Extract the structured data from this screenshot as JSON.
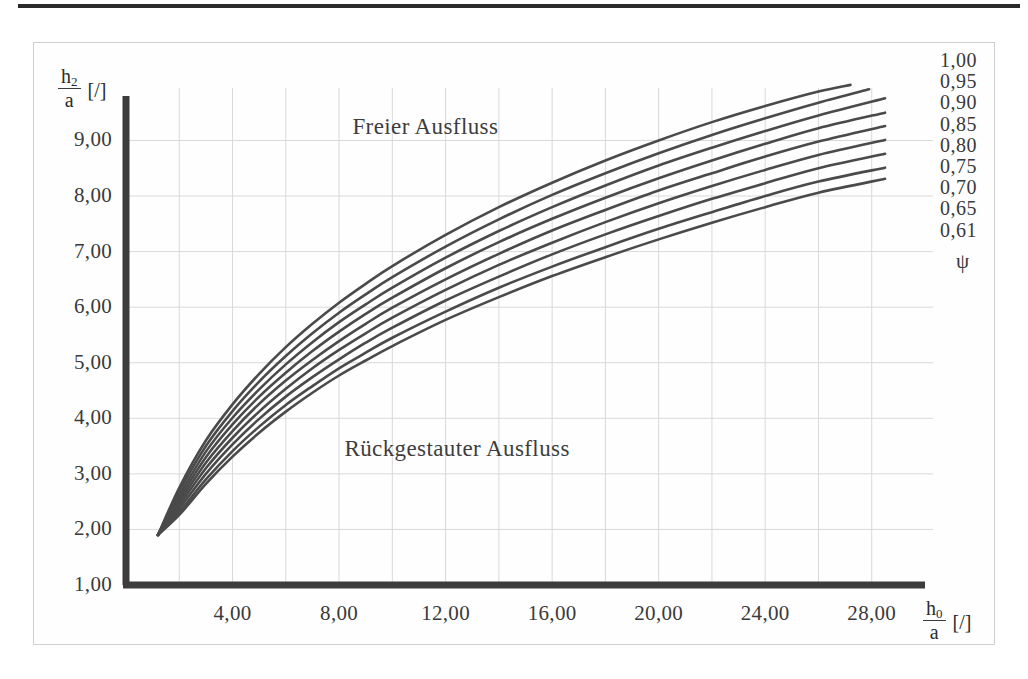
{
  "figure": {
    "name": "ausfluss-diagram",
    "top_rule": true
  },
  "chart_data": {
    "type": "line",
    "title": "",
    "xlabel": "h0/a [/]",
    "ylabel": "h2/a [/]",
    "xlabel_numerator": "h",
    "xlabel_numerator_sub": "0",
    "xlabel_denominator": "a",
    "xlabel_unit": "[/]",
    "ylabel_numerator": "h",
    "ylabel_numerator_sub": "2",
    "ylabel_denominator": "a",
    "ylabel_unit": "[/]",
    "xlim": [
      0,
      30
    ],
    "ylim": [
      1,
      9.8
    ],
    "xticks": [
      4,
      8,
      12,
      16,
      20,
      24,
      28
    ],
    "xtick_labels": [
      "4,00",
      "8,00",
      "12,00",
      "16,00",
      "20,00",
      "24,00",
      "28,00"
    ],
    "yticks": [
      1,
      2,
      3,
      4,
      5,
      6,
      7,
      8,
      9
    ],
    "ytick_labels": [
      "1,00",
      "2,00",
      "3,00",
      "4,00",
      "5,00",
      "6,00",
      "7,00",
      "8,00",
      "9,00"
    ],
    "grid": true,
    "grid_minor_x_step": 2,
    "grid_minor_y_step": 1,
    "grid_color": "#d9d9d9",
    "axis_color": "#3c3c3c",
    "curve_color": "#4a4a4a",
    "legend_position": "right",
    "legend_title": "ψ",
    "annotations": [
      {
        "text": "Freier Ausfluss",
        "x": 8.5,
        "y": 9.25
      },
      {
        "text": "Rückgestauter Ausfluss",
        "x": 8.2,
        "y": 3.45
      }
    ],
    "series": [
      {
        "name": "1,00",
        "legend_label": "1,00",
        "points": [
          [
            1.2,
            1.9
          ],
          [
            2,
            2.75
          ],
          [
            3,
            3.6
          ],
          [
            4,
            4.25
          ],
          [
            5,
            4.8
          ],
          [
            6,
            5.28
          ],
          [
            7,
            5.7
          ],
          [
            8,
            6.08
          ],
          [
            9,
            6.42
          ],
          [
            10,
            6.74
          ],
          [
            12,
            7.3
          ],
          [
            14,
            7.8
          ],
          [
            16,
            8.24
          ],
          [
            18,
            8.64
          ],
          [
            20,
            9.0
          ],
          [
            22,
            9.33
          ],
          [
            24,
            9.62
          ],
          [
            26,
            9.88
          ],
          [
            27.2,
            10.0
          ]
        ]
      },
      {
        "name": "0,95",
        "legend_label": "0,95",
        "points": [
          [
            1.2,
            1.9
          ],
          [
            2,
            2.68
          ],
          [
            3,
            3.5
          ],
          [
            4,
            4.13
          ],
          [
            5,
            4.66
          ],
          [
            6,
            5.12
          ],
          [
            7,
            5.53
          ],
          [
            8,
            5.9
          ],
          [
            9,
            6.23
          ],
          [
            10,
            6.54
          ],
          [
            12,
            7.09
          ],
          [
            14,
            7.58
          ],
          [
            16,
            8.02
          ],
          [
            18,
            8.41
          ],
          [
            20,
            8.77
          ],
          [
            22,
            9.1
          ],
          [
            24,
            9.4
          ],
          [
            26,
            9.68
          ],
          [
            27.9,
            9.92
          ]
        ]
      },
      {
        "name": "0,90",
        "legend_label": "0,90",
        "points": [
          [
            1.2,
            1.9
          ],
          [
            2,
            2.61
          ],
          [
            3,
            3.4
          ],
          [
            4,
            4.01
          ],
          [
            5,
            4.52
          ],
          [
            6,
            4.97
          ],
          [
            7,
            5.37
          ],
          [
            8,
            5.73
          ],
          [
            9,
            6.05
          ],
          [
            10,
            6.35
          ],
          [
            12,
            6.89
          ],
          [
            14,
            7.37
          ],
          [
            16,
            7.8
          ],
          [
            18,
            8.19
          ],
          [
            20,
            8.55
          ],
          [
            22,
            8.87
          ],
          [
            24,
            9.17
          ],
          [
            26,
            9.45
          ],
          [
            28.5,
            9.76
          ]
        ]
      },
      {
        "name": "0,85",
        "legend_label": "0,85",
        "points": [
          [
            1.2,
            1.9
          ],
          [
            2,
            2.55
          ],
          [
            3,
            3.3
          ],
          [
            4,
            3.89
          ],
          [
            5,
            4.39
          ],
          [
            6,
            4.82
          ],
          [
            7,
            5.21
          ],
          [
            8,
            5.56
          ],
          [
            9,
            5.88
          ],
          [
            10,
            6.17
          ],
          [
            12,
            6.7
          ],
          [
            14,
            7.17
          ],
          [
            16,
            7.59
          ],
          [
            18,
            7.97
          ],
          [
            20,
            8.32
          ],
          [
            22,
            8.64
          ],
          [
            24,
            8.94
          ],
          [
            26,
            9.22
          ],
          [
            28.5,
            9.5
          ]
        ]
      },
      {
        "name": "0,80",
        "legend_label": "0,80",
        "points": [
          [
            1.2,
            1.9
          ],
          [
            2,
            2.49
          ],
          [
            3,
            3.2
          ],
          [
            4,
            3.77
          ],
          [
            5,
            4.26
          ],
          [
            6,
            4.68
          ],
          [
            7,
            5.05
          ],
          [
            8,
            5.39
          ],
          [
            9,
            5.7
          ],
          [
            10,
            5.99
          ],
          [
            12,
            6.5
          ],
          [
            14,
            6.96
          ],
          [
            16,
            7.38
          ],
          [
            18,
            7.75
          ],
          [
            20,
            8.1
          ],
          [
            22,
            8.41
          ],
          [
            24,
            8.71
          ],
          [
            26,
            8.98
          ],
          [
            28.5,
            9.26
          ]
        ]
      },
      {
        "name": "0,75",
        "legend_label": "0,75",
        "points": [
          [
            1.2,
            1.9
          ],
          [
            2,
            2.43
          ],
          [
            3,
            3.1
          ],
          [
            4,
            3.65
          ],
          [
            5,
            4.12
          ],
          [
            6,
            4.53
          ],
          [
            7,
            4.9
          ],
          [
            8,
            5.23
          ],
          [
            9,
            5.53
          ],
          [
            10,
            5.81
          ],
          [
            12,
            6.31
          ],
          [
            14,
            6.76
          ],
          [
            16,
            7.16
          ],
          [
            18,
            7.53
          ],
          [
            20,
            7.87
          ],
          [
            22,
            8.18
          ],
          [
            24,
            8.47
          ],
          [
            26,
            8.74
          ],
          [
            28.5,
            9.01
          ]
        ]
      },
      {
        "name": "0,70",
        "legend_label": "0,70",
        "points": [
          [
            1.2,
            1.9
          ],
          [
            2,
            2.37
          ],
          [
            3,
            3.0
          ],
          [
            4,
            3.53
          ],
          [
            5,
            3.99
          ],
          [
            6,
            4.39
          ],
          [
            7,
            4.74
          ],
          [
            8,
            5.06
          ],
          [
            9,
            5.36
          ],
          [
            10,
            5.63
          ],
          [
            12,
            6.12
          ],
          [
            14,
            6.55
          ],
          [
            16,
            6.95
          ],
          [
            18,
            7.31
          ],
          [
            20,
            7.64
          ],
          [
            22,
            7.95
          ],
          [
            24,
            8.23
          ],
          [
            26,
            8.5
          ],
          [
            28.5,
            8.76
          ]
        ]
      },
      {
        "name": "0,65",
        "legend_label": "0,65",
        "points": [
          [
            1.2,
            1.9
          ],
          [
            2,
            2.31
          ],
          [
            3,
            2.9
          ],
          [
            4,
            3.41
          ],
          [
            5,
            3.85
          ],
          [
            6,
            4.24
          ],
          [
            7,
            4.58
          ],
          [
            8,
            4.9
          ],
          [
            9,
            5.18
          ],
          [
            10,
            5.45
          ],
          [
            12,
            5.92
          ],
          [
            14,
            6.35
          ],
          [
            16,
            6.73
          ],
          [
            18,
            7.08
          ],
          [
            20,
            7.41
          ],
          [
            22,
            7.71
          ],
          [
            24,
            8.0
          ],
          [
            26,
            8.26
          ],
          [
            28.5,
            8.51
          ]
        ]
      },
      {
        "name": "0,61",
        "legend_label": "0,61",
        "points": [
          [
            1.2,
            1.9
          ],
          [
            2,
            2.26
          ],
          [
            3,
            2.82
          ],
          [
            4,
            3.31
          ],
          [
            5,
            3.74
          ],
          [
            6,
            4.12
          ],
          [
            7,
            4.46
          ],
          [
            8,
            4.77
          ],
          [
            9,
            5.04
          ],
          [
            10,
            5.3
          ],
          [
            12,
            5.77
          ],
          [
            14,
            6.18
          ],
          [
            16,
            6.56
          ],
          [
            18,
            6.9
          ],
          [
            20,
            7.22
          ],
          [
            22,
            7.52
          ],
          [
            24,
            7.8
          ],
          [
            26,
            8.06
          ],
          [
            28.5,
            8.31
          ]
        ]
      }
    ],
    "legend_entries": [
      "1,00",
      "0,95",
      "0,90",
      "0,85",
      "0,80",
      "0,75",
      "0,70",
      "0,65",
      "0,61"
    ]
  }
}
